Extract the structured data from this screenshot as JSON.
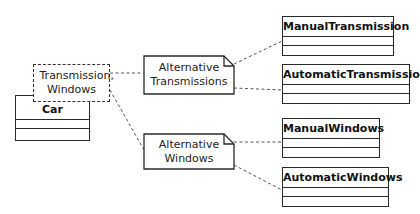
{
  "diagram": {
    "tagged_value": {
      "label": "Transmission, Windows"
    },
    "car": {
      "name": "Car"
    },
    "notes": [
      {
        "label": "Alternative Transmissions"
      },
      {
        "label": "Alternative Windows"
      }
    ],
    "classes": [
      {
        "name": "ManualTransmission"
      },
      {
        "name": "AutomaticTransmission"
      },
      {
        "name": "ManualWindows"
      },
      {
        "name": "AutomaticWindows"
      }
    ],
    "colors": {
      "line": "#2a2a2a",
      "background": "#ffffff"
    }
  }
}
